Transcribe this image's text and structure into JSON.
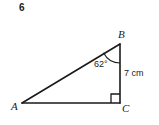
{
  "exercise": {
    "number": "6"
  },
  "figure": {
    "name": "right-triangle-abc",
    "vertices": {
      "a": "A",
      "b": "B",
      "c": "C"
    },
    "angle_at_b": "62°",
    "side_bc": "7 cm",
    "right_angle_at": "C",
    "stroke_color": "#1a1a1a",
    "background_color": "#ffffff"
  },
  "geometry": {
    "a_point": [
      22,
      103
    ],
    "b_point": [
      120,
      44
    ],
    "c_point": [
      120,
      103
    ]
  }
}
